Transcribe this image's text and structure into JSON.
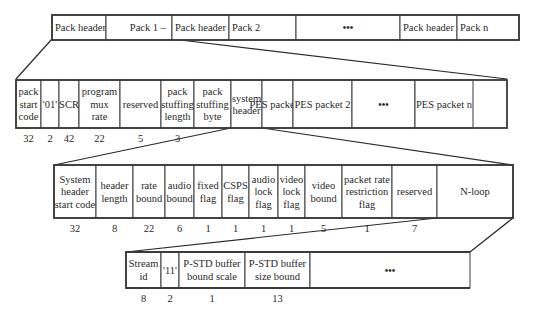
{
  "row1": {
    "cells": [
      {
        "label": [
          "Pack header"
        ]
      },
      {
        "label": [
          "Pack 1 –"
        ]
      },
      {
        "label": [
          "Pack header"
        ]
      },
      {
        "label": [
          "Pack 2"
        ]
      },
      {
        "label": [
          "●●●"
        ]
      },
      {
        "label": [
          "Pack header"
        ]
      },
      {
        "label": [
          "Pack n"
        ]
      }
    ]
  },
  "row2": {
    "cells": [
      {
        "label": [
          "pack",
          "start",
          "code"
        ],
        "bits": "32"
      },
      {
        "label": [
          "'01'"
        ],
        "bits": "2"
      },
      {
        "label": [
          "SCR"
        ],
        "bits": "42"
      },
      {
        "label": [
          "program",
          "mux",
          "rate"
        ],
        "bits": "22"
      },
      {
        "label": [
          "reserved"
        ],
        "bits": "5"
      },
      {
        "label": [
          "pack",
          "stuffing",
          "length"
        ],
        "bits": "3"
      },
      {
        "label": [
          "pack",
          "stuffing",
          "byte"
        ],
        "bits": ""
      },
      {
        "label": [
          "system",
          "header"
        ],
        "bits": ""
      },
      {
        "label": [
          "PES packet 1"
        ],
        "bits": ""
      },
      {
        "label": [
          "PES packet 2"
        ],
        "bits": ""
      },
      {
        "label": [
          "●●●"
        ],
        "bits": ""
      },
      {
        "label": [
          "PES packet n"
        ],
        "bits": ""
      }
    ]
  },
  "row3": {
    "cells": [
      {
        "label": [
          "System",
          "header",
          "start code"
        ],
        "bits": "32"
      },
      {
        "label": [
          "header",
          "length"
        ],
        "bits": "8"
      },
      {
        "label": [
          "rate",
          "bound"
        ],
        "bits": "22"
      },
      {
        "label": [
          "audio",
          "bound"
        ],
        "bits": "6"
      },
      {
        "label": [
          "fixed",
          "flag"
        ],
        "bits": "1"
      },
      {
        "label": [
          "CSPS",
          "flag"
        ],
        "bits": "1"
      },
      {
        "label": [
          "audio",
          "lock",
          "flag"
        ],
        "bits": "1"
      },
      {
        "label": [
          "video",
          "lock",
          "flag"
        ],
        "bits": "1"
      },
      {
        "label": [
          "video",
          "bound"
        ],
        "bits": "5"
      },
      {
        "label": [
          "packet rate",
          "restriction",
          "flag"
        ],
        "bits": "1"
      },
      {
        "label": [
          "reserved"
        ],
        "bits": "7"
      },
      {
        "label": [
          "N-loop"
        ],
        "bits": ""
      }
    ]
  },
  "row4": {
    "cells": [
      {
        "label": [
          "Stream",
          "id"
        ],
        "bits": "8"
      },
      {
        "label": [
          "'11'"
        ],
        "bits": "2"
      },
      {
        "label": [
          "P-STD buffer",
          "bound scale"
        ],
        "bits": "1"
      },
      {
        "label": [
          "P-STD buffer",
          "size bound"
        ],
        "bits": "13"
      },
      {
        "label": [
          "●●●"
        ],
        "bits": ""
      }
    ]
  }
}
